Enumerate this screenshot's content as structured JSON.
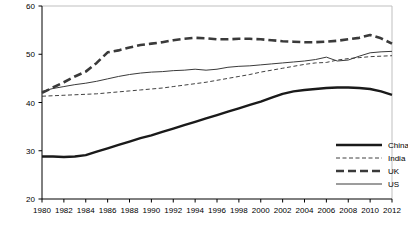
{
  "chart_data": {
    "type": "line",
    "title": "",
    "subtitle": "",
    "xlabel": "",
    "ylabel": "",
    "xlim": [
      1980,
      2012
    ],
    "ylim": [
      20,
      60
    ],
    "yticks": [
      20,
      30,
      40,
      50,
      60
    ],
    "xticks": [
      1980,
      1982,
      1984,
      1986,
      1988,
      1990,
      1992,
      1994,
      1996,
      1998,
      2000,
      2002,
      2004,
      2006,
      2008,
      2010,
      2012
    ],
    "xtick_labels": [
      "1980",
      "1982",
      "1984",
      "1986",
      "1988",
      "1990",
      "1992",
      "1994",
      "1996",
      "1998",
      "2000",
      "2002",
      "2004",
      "2006",
      "2008",
      "2010",
      "2012"
    ],
    "ytick_labels": [
      "20",
      "30",
      "40",
      "50",
      "60"
    ],
    "grid": false,
    "top_border": true,
    "legend_position": "inside-bottom-right",
    "x": [
      1980,
      1981,
      1982,
      1983,
      1984,
      1985,
      1986,
      1987,
      1988,
      1989,
      1990,
      1991,
      1992,
      1993,
      1994,
      1995,
      1996,
      1997,
      1998,
      1999,
      2000,
      2001,
      2002,
      2003,
      2004,
      2005,
      2006,
      2007,
      2008,
      2009,
      2010,
      2011,
      2012
    ],
    "series": [
      {
        "name": "China",
        "style": "thick-solid",
        "color": "#1a1a1a",
        "width": 2.4,
        "dash": "none",
        "values": [
          28.8,
          28.8,
          28.7,
          28.8,
          29.1,
          29.8,
          30.5,
          31.2,
          31.9,
          32.6,
          33.2,
          33.9,
          34.6,
          35.3,
          36.0,
          36.7,
          37.4,
          38.1,
          38.8,
          39.5,
          40.2,
          41.0,
          41.8,
          42.3,
          42.6,
          42.8,
          43.0,
          43.1,
          43.1,
          43.0,
          42.8,
          42.3,
          41.6
        ]
      },
      {
        "name": "India",
        "style": "thin-dashed",
        "color": "#2b2b2b",
        "width": 0.9,
        "dash": "4,2.5",
        "values": [
          41.3,
          41.4,
          41.5,
          41.6,
          41.7,
          41.8,
          42.0,
          42.2,
          42.4,
          42.6,
          42.8,
          43.0,
          43.3,
          43.6,
          43.9,
          44.2,
          44.6,
          45.0,
          45.4,
          45.8,
          46.3,
          46.7,
          47.1,
          47.5,
          47.9,
          48.2,
          48.3,
          48.8,
          49.1,
          49.3,
          49.5,
          49.6,
          49.7
        ]
      },
      {
        "name": "UK",
        "style": "thick-dashed",
        "color": "#3a3a3a",
        "width": 2.6,
        "dash": "8,4",
        "values": [
          42.0,
          43.1,
          44.2,
          45.4,
          46.4,
          48.2,
          50.4,
          50.8,
          51.4,
          51.9,
          52.2,
          52.5,
          52.9,
          53.2,
          53.4,
          53.3,
          53.1,
          53.1,
          53.2,
          53.2,
          53.1,
          52.9,
          52.7,
          52.6,
          52.5,
          52.5,
          52.6,
          52.8,
          53.1,
          53.4,
          54.0,
          53.3,
          52.2
        ]
      },
      {
        "name": "US",
        "style": "thin-solid",
        "color": "#3a3a3a",
        "width": 1.0,
        "dash": "none",
        "values": [
          42.3,
          42.9,
          43.3,
          43.7,
          44.0,
          44.4,
          44.9,
          45.4,
          45.8,
          46.1,
          46.3,
          46.4,
          46.6,
          46.7,
          46.9,
          46.7,
          46.9,
          47.3,
          47.5,
          47.6,
          47.8,
          48.0,
          48.2,
          48.4,
          48.6,
          48.9,
          49.4,
          48.6,
          48.8,
          49.6,
          50.3,
          50.5,
          50.6
        ]
      }
    ]
  },
  "legend": {
    "entries": [
      {
        "label": "China"
      },
      {
        "label": "India"
      },
      {
        "label": "UK"
      },
      {
        "label": "US"
      }
    ]
  },
  "colors": {
    "axis": "#000000",
    "plot_border": "#bfbfbf",
    "background": "#ffffff",
    "text": "#000000"
  }
}
